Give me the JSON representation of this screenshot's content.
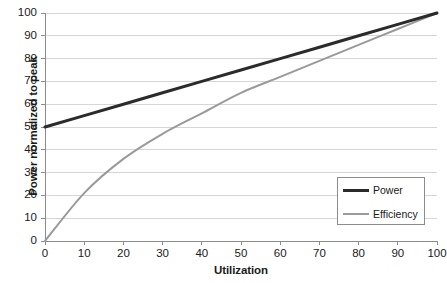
{
  "chart_data": {
    "type": "line",
    "title": "",
    "xlabel": "Utilization",
    "ylabel": "Power normalized to peak",
    "xlim": [
      0,
      100
    ],
    "ylim": [
      0,
      100
    ],
    "xticks": [
      0,
      10,
      20,
      30,
      40,
      50,
      60,
      70,
      80,
      90,
      100
    ],
    "yticks": [
      0,
      10,
      20,
      30,
      40,
      50,
      60,
      70,
      80,
      90,
      100
    ],
    "grid": "horizontal",
    "legend_position": "lower-right",
    "x": [
      0,
      10,
      20,
      30,
      40,
      50,
      60,
      70,
      80,
      90,
      100
    ],
    "series": [
      {
        "name": "Power",
        "color": "#2b2b2b",
        "width": 3,
        "values": [
          50,
          55,
          60,
          65,
          70,
          75,
          80,
          85,
          90,
          95,
          100
        ]
      },
      {
        "name": "Efficiency",
        "color": "#9a9a9a",
        "width": 2,
        "values": [
          0,
          21,
          36,
          47,
          56,
          65,
          72,
          79,
          86,
          93,
          100
        ]
      }
    ]
  },
  "axes": {
    "y_title": "Power normalized to peak",
    "x_title": "Utilization",
    "y_tick_labels": [
      "0",
      "10",
      "20",
      "30",
      "40",
      "50",
      "60",
      "70",
      "80",
      "90",
      "100"
    ],
    "x_tick_labels": [
      "0",
      "10",
      "20",
      "30",
      "40",
      "50",
      "60",
      "70",
      "80",
      "90",
      "100"
    ]
  },
  "legend": {
    "items": [
      {
        "label": "Power",
        "color": "#2b2b2b"
      },
      {
        "label": "Efficiency",
        "color": "#9a9a9a"
      }
    ]
  },
  "colors": {
    "power_line": "#2b2b2b",
    "efficiency_line": "#9a9a9a",
    "gridline": "#d6d6d6",
    "axis": "#8c8c8c",
    "background": "#ffffff",
    "text": "#1a1a1a"
  }
}
